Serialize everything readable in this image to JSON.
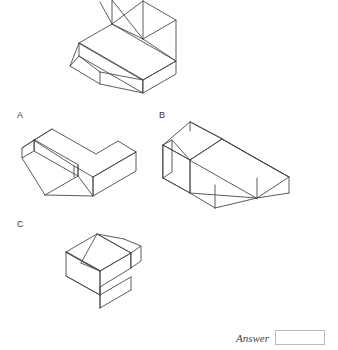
{
  "page": {
    "background_color": "#ffffff",
    "line_color": "#4a4a4a",
    "question_type": "isometric-solid-matching"
  },
  "question_figure": {
    "name": "prompt-solid",
    "description": "Isometric drawing of an L-shaped / triangular-prism solid, cropped at the top edge of the image"
  },
  "options": [
    {
      "id": "A",
      "label": "A",
      "description": "Isometric L-shaped solid with angled chamfered end at upper left"
    },
    {
      "id": "B",
      "label": "B",
      "description": "Isometric solid with cube at left, ridged prism body extending to the lower right"
    },
    {
      "id": "C",
      "label": "C",
      "description": "Isometric solid with a ridged prism and a block stepping down at front"
    }
  ],
  "answer": {
    "label": "Answer",
    "value": "",
    "placeholder": ""
  },
  "colors": {
    "stroke": "#4a4a4a",
    "stroke_light": "#7d7d7d",
    "text": "#3a3a3a",
    "box_border": "#b9b9b9"
  }
}
